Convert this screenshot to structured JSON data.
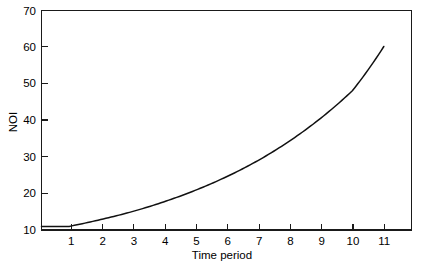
{
  "chart_data": {
    "type": "line",
    "title": "",
    "subtitle": "",
    "xlabel": "Time period",
    "ylabel": "NOI",
    "xlim": [
      0.12,
      11.88
    ],
    "ylim": [
      9.0,
      70.0
    ],
    "grid": false,
    "legend": null,
    "x_ticks": [
      1,
      2,
      3,
      4,
      5,
      6,
      7,
      8,
      9,
      10,
      11
    ],
    "x_tick_labels": [
      "1",
      "2",
      "3",
      "4",
      "5",
      "6",
      "7",
      "8",
      "9",
      "10",
      "11"
    ],
    "y_ticks": [
      10,
      20,
      30,
      40,
      50,
      60,
      70
    ],
    "y_tick_labels": [
      "10",
      "20",
      "30",
      "40",
      "50",
      "60",
      "70"
    ],
    "series": [
      {
        "name": "NOI",
        "color": "#111111",
        "x": [
          1,
          2,
          3,
          4,
          5,
          6,
          7,
          8,
          9,
          10,
          11
        ],
        "values": [
          10.0,
          11.9,
          14.1,
          16.8,
          20.0,
          23.8,
          28.3,
          33.7,
          40.1,
          47.7,
          60.0
        ]
      }
    ],
    "annotations": []
  },
  "axes": {
    "y_label": "NOI",
    "x_label": "Time period",
    "y_tick_0": "10",
    "y_tick_1": "20",
    "y_tick_2": "30",
    "y_tick_3": "40",
    "y_tick_4": "50",
    "y_tick_5": "60",
    "y_tick_6": "70",
    "x_tick_0": "1",
    "x_tick_1": "2",
    "x_tick_2": "3",
    "x_tick_3": "4",
    "x_tick_4": "5",
    "x_tick_5": "6",
    "x_tick_6": "7",
    "x_tick_7": "8",
    "x_tick_8": "9",
    "x_tick_9": "10",
    "x_tick_10": "11"
  },
  "colors": {
    "curve": "#111111",
    "frame": "#1a1a1a",
    "background": "#ffffff"
  }
}
